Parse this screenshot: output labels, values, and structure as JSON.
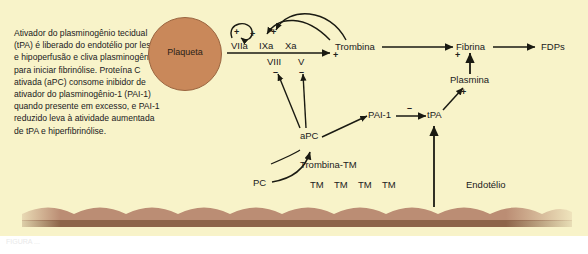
{
  "figure": {
    "background_color": "#f8f3c9",
    "platelet_color": "#c9885a",
    "membrane_top_color": "#bb8d74",
    "membrane_bottom_color": "#8d6449",
    "stroke_color": "#1a1a12"
  },
  "intro": {
    "text": "Ativador do plasminogênio tecidual (tPA) é liberado do endotélio por lesão e hipoperfusão e cliva plasminogênio para iniciar fibrinólise. Proteína C ativada (aPC) consome inibidor de ativador do plasminogênio-1 (PAI-1) quando presente em excesso, e PAI-1 reduzido leva à atividade aumentada de tPA e hiperfibrinólise."
  },
  "nodes": {
    "platelet": "Plaqueta",
    "viia": "VIIa",
    "ixa": "IXa",
    "xa": "Xa",
    "viii": "VIII",
    "v": "V",
    "thrombin": "Trombina",
    "fibrin": "Fibrina",
    "fdps": "FDPs",
    "plasmin": "Plasmina",
    "tpa": "tPA",
    "pai1": "PAI-1",
    "apc": "aPC",
    "thrombin_tm": "Trombina-TM",
    "pc": "PC",
    "tm1": "TM",
    "tm2": "TM",
    "tm3": "TM",
    "tm4": "TM",
    "endothelium": "Endotélio"
  },
  "signs": {
    "loop_left": "+",
    "loop_right": "+",
    "ixa_plus": "+",
    "thrombin_plus": "+",
    "fibrin_plus": "+",
    "viii_minus": "–",
    "v_minus": "–",
    "pai1_minus": "–",
    "plasmin_plus": "+"
  },
  "caption": {
    "ghost_line": "FIGURA ..."
  }
}
